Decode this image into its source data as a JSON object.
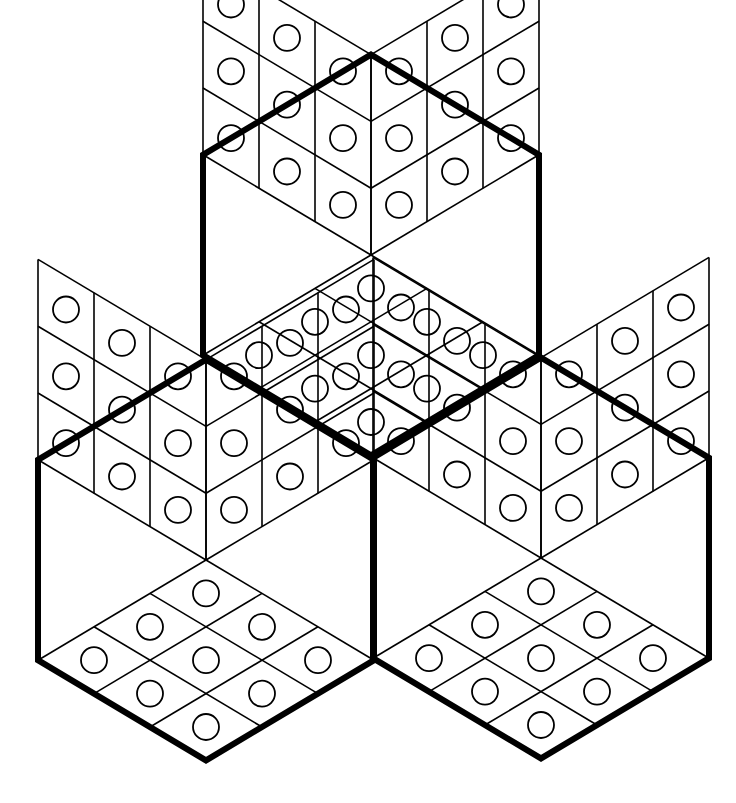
{
  "figure": {
    "background": "#ffffff",
    "line_color": "#000000",
    "outline_width": 6,
    "grid_width": 1.6,
    "circle_radius": 13,
    "circle_stroke": 1.8,
    "unit_x": 56,
    "unit_y": 33.4,
    "grid_divisions": 3,
    "hexagons": [
      {
        "name": "top-hexagon",
        "corner": [
          371,
          255
        ]
      },
      {
        "name": "left-hexagon",
        "corner": [
          206,
          560
        ]
      },
      {
        "name": "right-hexagon",
        "corner": [
          541,
          558
        ]
      }
    ]
  }
}
